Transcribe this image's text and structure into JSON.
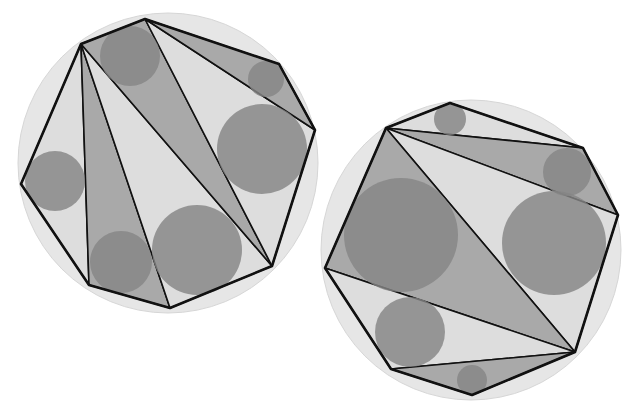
{
  "colors": {
    "background": "#ffffff",
    "circumcircle": "#e6e6e6",
    "polygon_fill": "#dcdcdc",
    "triangle_shaded": "#a9a9a9",
    "triangle_light": "#dddddd",
    "incircle": "#858585",
    "stroke": "#111111"
  },
  "figures": [
    {
      "name": "left-octagon",
      "circumcircle": {
        "cx": 168,
        "cy": 163,
        "r": 150
      },
      "vertices": [
        [
          81,
          44
        ],
        [
          145,
          19
        ],
        [
          279,
          64
        ],
        [
          315,
          130
        ],
        [
          272,
          266
        ],
        [
          170,
          308
        ],
        [
          89,
          285
        ],
        [
          21,
          184
        ]
      ],
      "triangles": [
        {
          "pts": [
            [
              81,
              44
            ],
            [
              21,
              184
            ],
            [
              89,
              285
            ]
          ],
          "shade": "light"
        },
        {
          "pts": [
            [
              81,
              44
            ],
            [
              89,
              285
            ],
            [
              170,
              308
            ]
          ],
          "shade": "dark"
        },
        {
          "pts": [
            [
              81,
              44
            ],
            [
              170,
              308
            ],
            [
              272,
              266
            ]
          ],
          "shade": "light"
        },
        {
          "pts": [
            [
              81,
              44
            ],
            [
              145,
              19
            ],
            [
              272,
              266
            ]
          ],
          "shade": "dark"
        },
        {
          "pts": [
            [
              145,
              19
            ],
            [
              315,
              130
            ],
            [
              272,
              266
            ]
          ],
          "shade": "light"
        },
        {
          "pts": [
            [
              145,
              19
            ],
            [
              279,
              64
            ],
            [
              315,
              130
            ]
          ],
          "shade": "dark"
        }
      ],
      "incircles": [
        {
          "cx": 130,
          "cy": 56,
          "r": 30
        },
        {
          "cx": 266,
          "cy": 79,
          "r": 18
        },
        {
          "cx": 262,
          "cy": 149,
          "r": 45
        },
        {
          "cx": 55,
          "cy": 181,
          "r": 30
        },
        {
          "cx": 121,
          "cy": 262,
          "r": 31
        },
        {
          "cx": 197,
          "cy": 250,
          "r": 45
        }
      ]
    },
    {
      "name": "right-octagon",
      "circumcircle": {
        "cx": 471,
        "cy": 250,
        "r": 150
      },
      "vertices": [
        [
          386,
          128
        ],
        [
          450,
          103
        ],
        [
          583,
          148
        ],
        [
          618,
          215
        ],
        [
          575,
          352
        ],
        [
          472,
          395
        ],
        [
          391,
          369
        ],
        [
          325,
          268
        ]
      ],
      "triangles": [
        {
          "pts": [
            [
              386,
              128
            ],
            [
              450,
              103
            ],
            [
              583,
              148
            ]
          ],
          "shade": "light"
        },
        {
          "pts": [
            [
              386,
              128
            ],
            [
              583,
              148
            ],
            [
              618,
              215
            ]
          ],
          "shade": "dark"
        },
        {
          "pts": [
            [
              386,
              128
            ],
            [
              618,
              215
            ],
            [
              575,
              352
            ]
          ],
          "shade": "light"
        },
        {
          "pts": [
            [
              386,
              128
            ],
            [
              575,
              352
            ],
            [
              325,
              268
            ]
          ],
          "shade": "dark"
        },
        {
          "pts": [
            [
              325,
              268
            ],
            [
              575,
              352
            ],
            [
              391,
              369
            ]
          ],
          "shade": "light"
        },
        {
          "pts": [
            [
              391,
              369
            ],
            [
              575,
              352
            ],
            [
              472,
              395
            ]
          ],
          "shade": "dark"
        }
      ],
      "incircles": [
        {
          "cx": 450,
          "cy": 119,
          "r": 16
        },
        {
          "cx": 567,
          "cy": 172,
          "r": 24
        },
        {
          "cx": 401,
          "cy": 235,
          "r": 57
        },
        {
          "cx": 554,
          "cy": 243,
          "r": 52
        },
        {
          "cx": 410,
          "cy": 332,
          "r": 35
        },
        {
          "cx": 472,
          "cy": 380,
          "r": 15
        }
      ]
    }
  ]
}
